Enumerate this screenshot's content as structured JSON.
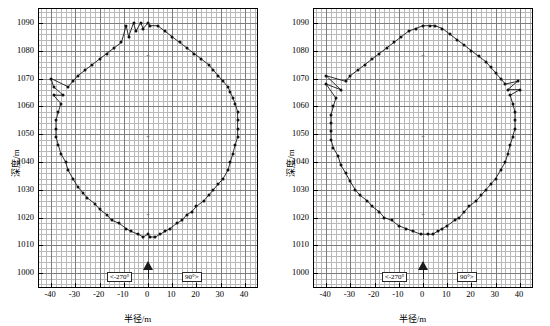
{
  "chart_data": [
    {
      "type": "scatter",
      "title": "",
      "xlabel": "半径/m",
      "ylabel": "深度/m",
      "xlim": [
        -45,
        45
      ],
      "ylim": [
        1095,
        995
      ],
      "xticks": [
        -40,
        -30,
        -20,
        -10,
        0,
        10,
        20,
        30,
        40
      ],
      "xtick_labels": [
        "-40",
        "-30",
        "-20",
        "-10",
        "0",
        "10",
        "20",
        "30",
        "40"
      ],
      "yticks": [
        1000,
        1010,
        1020,
        1030,
        1040,
        1050,
        1060,
        1070,
        1080,
        1090
      ],
      "ytick_labels": [
        "1000",
        "1010",
        "1020",
        "1030",
        "1040",
        "1050",
        "1060",
        "1070",
        "1080",
        "1090"
      ],
      "grid": true,
      "annotations": [
        {
          "text": "<-270°",
          "x": -17,
          "y": 999
        },
        {
          "text": "90°>",
          "x": 14,
          "y": 999
        },
        {
          "text": "N",
          "x": 0,
          "y": 1003
        },
        {
          "text": "+",
          "x": 0,
          "y": 1021
        },
        {
          "text": "+",
          "x": 0,
          "y": 1049
        },
        {
          "text": "+",
          "x": 0,
          "y": 1078
        }
      ],
      "points": [
        [
          -2,
          1013
        ],
        [
          1,
          1013
        ],
        [
          3,
          1013
        ],
        [
          5,
          1014
        ],
        [
          0,
          1014
        ],
        [
          -4,
          1014
        ],
        [
          -7,
          1015
        ],
        [
          7,
          1015
        ],
        [
          9,
          1016
        ],
        [
          -9,
          1016
        ],
        [
          -12,
          1018
        ],
        [
          12,
          1018
        ],
        [
          -15,
          1019
        ],
        [
          14,
          1019
        ],
        [
          -17,
          1021
        ],
        [
          16,
          1021
        ],
        [
          -20,
          1023
        ],
        [
          18,
          1022
        ],
        [
          -22,
          1025
        ],
        [
          20,
          1024
        ],
        [
          -25,
          1027
        ],
        [
          23,
          1026
        ],
        [
          -27,
          1029
        ],
        [
          25,
          1028
        ],
        [
          -29,
          1031
        ],
        [
          27,
          1030
        ],
        [
          -31,
          1034
        ],
        [
          29,
          1032
        ],
        [
          -33,
          1037
        ],
        [
          31,
          1034
        ],
        [
          -34,
          1040
        ],
        [
          33,
          1037
        ],
        [
          -36,
          1043
        ],
        [
          34,
          1040
        ],
        [
          -37,
          1046
        ],
        [
          35,
          1043
        ],
        [
          -38,
          1049
        ],
        [
          36,
          1046
        ],
        [
          -38,
          1052
        ],
        [
          37,
          1049
        ],
        [
          -38,
          1055
        ],
        [
          37,
          1052
        ],
        [
          -37,
          1058
        ],
        [
          37,
          1055
        ],
        [
          -36,
          1061
        ],
        [
          37,
          1058
        ],
        [
          -35,
          1064
        ],
        [
          36,
          1061
        ],
        [
          -33,
          1067
        ],
        [
          35,
          1063
        ],
        [
          -31,
          1069
        ],
        [
          34,
          1065
        ],
        [
          -29,
          1071
        ],
        [
          33,
          1067
        ],
        [
          -26,
          1073
        ],
        [
          31,
          1069
        ],
        [
          -23,
          1075
        ],
        [
          29,
          1071
        ],
        [
          -20,
          1077
        ],
        [
          27,
          1073
        ],
        [
          -17,
          1079
        ],
        [
          25,
          1075
        ],
        [
          -14,
          1081
        ],
        [
          22,
          1077
        ],
        [
          -11,
          1083
        ],
        [
          19,
          1079
        ],
        [
          -8,
          1085
        ],
        [
          16,
          1081
        ],
        [
          -5,
          1087
        ],
        [
          13,
          1083
        ],
        [
          -2,
          1088
        ],
        [
          10,
          1085
        ],
        [
          1,
          1089
        ],
        [
          7,
          1087
        ],
        [
          4,
          1089
        ],
        [
          -9,
          1089
        ],
        [
          -6,
          1090
        ],
        [
          -3,
          1090
        ],
        [
          0,
          1090
        ],
        [
          -40,
          1070
        ],
        [
          -39,
          1067
        ],
        [
          -39,
          1064
        ]
      ]
    },
    {
      "type": "scatter",
      "title": "",
      "xlabel": "半径/m",
      "ylabel": "深度/m",
      "xlim": [
        -45,
        45
      ],
      "ylim": [
        1095,
        995
      ],
      "xticks": [
        -40,
        -30,
        -20,
        -10,
        0,
        10,
        20,
        30,
        40
      ],
      "xtick_labels": [
        "-40",
        "-30",
        "-20",
        "-10",
        "0",
        "10",
        "20",
        "30",
        "40"
      ],
      "yticks": [
        1000,
        1010,
        1020,
        1030,
        1040,
        1050,
        1060,
        1070,
        1080,
        1090
      ],
      "ytick_labels": [
        "1000",
        "1010",
        "1020",
        "1030",
        "1040",
        "1050",
        "1060",
        "1070",
        "1080",
        "1090"
      ],
      "grid": true,
      "annotations": [
        {
          "text": "<-270°",
          "x": -17,
          "y": 999
        },
        {
          "text": "90°>",
          "x": 14,
          "y": 999
        },
        {
          "text": "N",
          "x": 0,
          "y": 1003
        },
        {
          "text": "+",
          "x": 0,
          "y": 1021
        },
        {
          "text": "+",
          "x": 0,
          "y": 1049
        },
        {
          "text": "+",
          "x": 0,
          "y": 1078
        }
      ],
      "points": [
        [
          -1,
          1014
        ],
        [
          2,
          1014
        ],
        [
          4,
          1014
        ],
        [
          6,
          1015
        ],
        [
          -4,
          1015
        ],
        [
          -7,
          1016
        ],
        [
          8,
          1016
        ],
        [
          10,
          1017
        ],
        [
          -10,
          1017
        ],
        [
          -13,
          1019
        ],
        [
          13,
          1019
        ],
        [
          -16,
          1020
        ],
        [
          15,
          1020
        ],
        [
          -18,
          1022
        ],
        [
          17,
          1022
        ],
        [
          -21,
          1024
        ],
        [
          19,
          1024
        ],
        [
          -23,
          1026
        ],
        [
          22,
          1026
        ],
        [
          -26,
          1028
        ],
        [
          24,
          1028
        ],
        [
          -28,
          1030
        ],
        [
          26,
          1030
        ],
        [
          -30,
          1033
        ],
        [
          28,
          1032
        ],
        [
          -32,
          1036
        ],
        [
          30,
          1034
        ],
        [
          -34,
          1039
        ],
        [
          32,
          1037
        ],
        [
          -35,
          1042
        ],
        [
          34,
          1040
        ],
        [
          -37,
          1045
        ],
        [
          35,
          1043
        ],
        [
          -38,
          1048
        ],
        [
          36,
          1046
        ],
        [
          -38,
          1051
        ],
        [
          37,
          1049
        ],
        [
          -38,
          1054
        ],
        [
          38,
          1052
        ],
        [
          -38,
          1057
        ],
        [
          38,
          1055
        ],
        [
          -37,
          1060
        ],
        [
          38,
          1058
        ],
        [
          -36,
          1063
        ],
        [
          37,
          1061
        ],
        [
          -34,
          1066
        ],
        [
          36,
          1064
        ],
        [
          -32,
          1069
        ],
        [
          35,
          1066
        ],
        [
          -30,
          1071
        ],
        [
          34,
          1068
        ],
        [
          -27,
          1073
        ],
        [
          32,
          1070
        ],
        [
          -24,
          1075
        ],
        [
          30,
          1072
        ],
        [
          -21,
          1077
        ],
        [
          28,
          1074
        ],
        [
          -18,
          1079
        ],
        [
          26,
          1076
        ],
        [
          -15,
          1081
        ],
        [
          23,
          1078
        ],
        [
          -12,
          1083
        ],
        [
          20,
          1080
        ],
        [
          -9,
          1085
        ],
        [
          17,
          1082
        ],
        [
          -6,
          1087
        ],
        [
          14,
          1084
        ],
        [
          -3,
          1088
        ],
        [
          11,
          1086
        ],
        [
          0,
          1089
        ],
        [
          8,
          1088
        ],
        [
          3,
          1089
        ],
        [
          5,
          1089
        ],
        [
          -40,
          1071
        ],
        [
          -40,
          1068
        ],
        [
          39,
          1069
        ],
        [
          40,
          1066
        ]
      ]
    }
  ]
}
